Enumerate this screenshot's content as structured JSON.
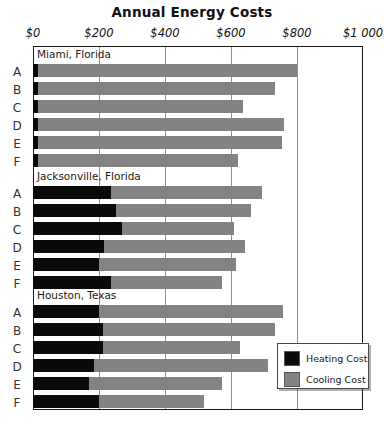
{
  "chart_data": {
    "type": "bar",
    "orientation": "horizontal",
    "stacked": true,
    "title": "Annual Energy Costs",
    "xlabel": "",
    "ylabel": "",
    "xlim": [
      0,
      1000
    ],
    "grid": true,
    "grid_axis": "x",
    "legend_position": "bottom-right",
    "xticks": [
      0,
      200,
      400,
      600,
      800,
      1000
    ],
    "xtick_labels": [
      "$0",
      "$200",
      "$400",
      "$600",
      "$800",
      "$1 000"
    ],
    "series": [
      {
        "name": "Heating Cost",
        "color": "#0a0a0a"
      },
      {
        "name": "Cooling Cost",
        "color": "#838383"
      }
    ],
    "groups": [
      {
        "name": "Miami, Florida",
        "categories": [
          "A",
          "B",
          "C",
          "D",
          "E",
          "F"
        ],
        "heating": [
          15,
          15,
          15,
          15,
          15,
          15
        ],
        "cooling": [
          785,
          718,
          621,
          746,
          740,
          606
        ],
        "totals": [
          800,
          733,
          636,
          761,
          755,
          621
        ]
      },
      {
        "name": "Jacksonville, Florida",
        "categories": [
          "A",
          "B",
          "C",
          "D",
          "E",
          "F"
        ],
        "heating": [
          235,
          252,
          270,
          215,
          200,
          237
        ],
        "cooling": [
          459,
          409,
          339,
          427,
          415,
          336
        ],
        "totals": [
          694,
          661,
          609,
          642,
          615,
          573
        ]
      },
      {
        "name": "Houston, Texas",
        "categories": [
          "A",
          "B",
          "C",
          "D",
          "E",
          "F"
        ],
        "heating": [
          200,
          212,
          212,
          185,
          170,
          200
        ],
        "cooling": [
          558,
          521,
          415,
          527,
          403,
          318
        ],
        "totals": [
          758,
          733,
          627,
          712,
          573,
          518
        ]
      }
    ]
  },
  "legend": {
    "items": [
      {
        "label": "Heating Cost",
        "color": "#0a0a0a"
      },
      {
        "label": "Cooling Cost",
        "color": "#838383"
      }
    ]
  }
}
